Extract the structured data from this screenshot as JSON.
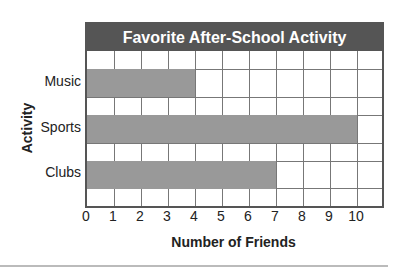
{
  "chart_data": {
    "type": "bar",
    "orientation": "horizontal",
    "title": "Favorite After-School Activity",
    "xlabel": "Number of Friends",
    "ylabel": "Activity",
    "categories": [
      "Music",
      "Sports",
      "Clubs"
    ],
    "values": [
      4,
      10,
      7
    ],
    "xlim": [
      0,
      11
    ],
    "xticks": [
      "0",
      "1",
      "2",
      "3",
      "4",
      "5",
      "6",
      "7",
      "8",
      "9",
      "10"
    ],
    "grid": true,
    "colors": {
      "bar": "#999999",
      "header": "#555555",
      "grid": "#777777"
    }
  }
}
